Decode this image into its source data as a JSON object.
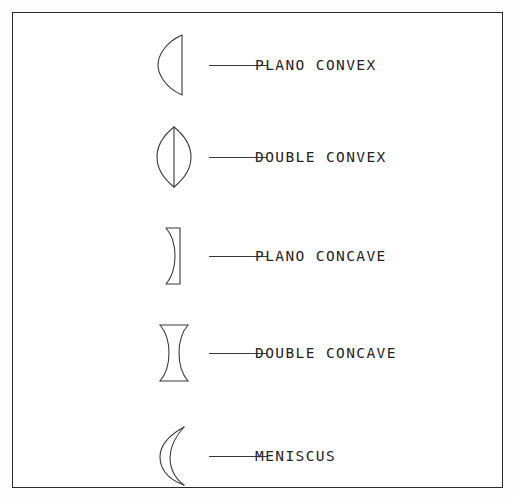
{
  "diagram": {
    "background_color": "#ffffff",
    "border_color": "#2b2b2b",
    "stroke_color": "#3a3a3a",
    "text_color": "#242424",
    "rows": [
      {
        "id": "plano-convex",
        "label": "PLANO CONVEX",
        "shape": "plano-convex-lens",
        "description": "flat right surface, convex curved left surface"
      },
      {
        "id": "double-convex",
        "label": "DOUBLE CONVEX",
        "shape": "double-convex-lens",
        "description": "both surfaces convex, lens shape with center line"
      },
      {
        "id": "plano-concave",
        "label": "PLANO CONCAVE",
        "shape": "plano-concave-lens",
        "description": "flat right surface, concave curved left surface"
      },
      {
        "id": "double-concave",
        "label": "DOUBLE CONCAVE",
        "shape": "double-concave-lens",
        "description": "both surfaces concave, hourglass shape with flat top and bottom"
      },
      {
        "id": "meniscus",
        "label": "MENISCUS",
        "shape": "meniscus-lens",
        "description": "crescent shape, both surfaces curved the same direction"
      }
    ]
  }
}
